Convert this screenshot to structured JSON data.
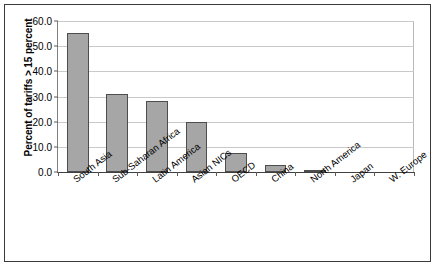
{
  "chart_data": {
    "type": "bar",
    "title": "",
    "xlabel": "",
    "ylabel": "Percent of tariffs > 15 percent",
    "ylim": [
      0,
      60
    ],
    "ytick_labels": [
      "60.0",
      "50.0",
      "40.0",
      "30.0",
      "20.0",
      "10.0",
      "0.0"
    ],
    "ytick_values": [
      60,
      50,
      40,
      30,
      20,
      10,
      0
    ],
    "grid": true,
    "legend": "none",
    "bar_color": "#a6a6a6",
    "bar_edge_color": "#4d4d4d",
    "categories": [
      "South Asia",
      "Sub-Saharan Africa",
      "Latin America",
      "Asian NICs",
      "OECD",
      "China",
      "North America",
      "Japan",
      "W. Europe"
    ],
    "values": [
      55.2,
      31.0,
      28.4,
      20.0,
      7.6,
      2.7,
      0.8,
      0.0,
      0.0
    ]
  }
}
